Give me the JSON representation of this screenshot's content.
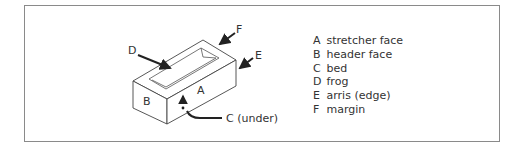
{
  "diagram": {
    "face_labels": {
      "A": "A",
      "B": "B"
    },
    "callouts": {
      "C": "C (under)",
      "D": "D",
      "E": "E",
      "F": "F"
    },
    "legend": [
      {
        "key": "A",
        "label": "stretcher face"
      },
      {
        "key": "B",
        "label": "header face"
      },
      {
        "key": "C",
        "label": "bed"
      },
      {
        "key": "D",
        "label": "frog"
      },
      {
        "key": "E",
        "label": "arris (edge)"
      },
      {
        "key": "F",
        "label": "margin"
      }
    ],
    "colors": {
      "line": "#333333",
      "border": "#8a8a8a"
    }
  }
}
